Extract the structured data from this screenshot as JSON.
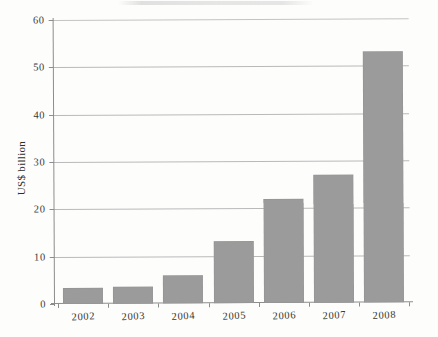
{
  "chart_data": {
    "type": "bar",
    "title": "",
    "subtitle": "",
    "xlabel": "",
    "ylabel": "US$ billion",
    "categories": [
      "2002",
      "2003",
      "2004",
      "2005",
      "2006",
      "2007",
      "2008"
    ],
    "values": [
      3.3,
      3.6,
      6,
      13,
      22,
      27,
      53
    ],
    "series": [
      {
        "name": "US$ billion",
        "values": [
          3.3,
          3.6,
          6,
          13,
          22,
          27,
          53
        ]
      }
    ],
    "ylim": [
      0,
      60
    ],
    "ytick_labels": [
      "0",
      "10",
      "20",
      "30",
      "40",
      "50",
      "60"
    ],
    "ytick_values": [
      0,
      10,
      20,
      30,
      40,
      50,
      60
    ],
    "grid": true,
    "legend": false,
    "legend_position": "none",
    "bar_color": "#9b9b9b",
    "axis_color": "#8d8d8d",
    "gridline_color": "#b9b9b9",
    "background_color": "#fdfdfc"
  },
  "figure": {
    "axis_label_y": "US$ billion"
  }
}
